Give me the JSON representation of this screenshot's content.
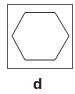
{
  "figure": {
    "label": "d",
    "shape": "hexagon",
    "frame_color": "#555555",
    "stroke_color": "#333333"
  }
}
